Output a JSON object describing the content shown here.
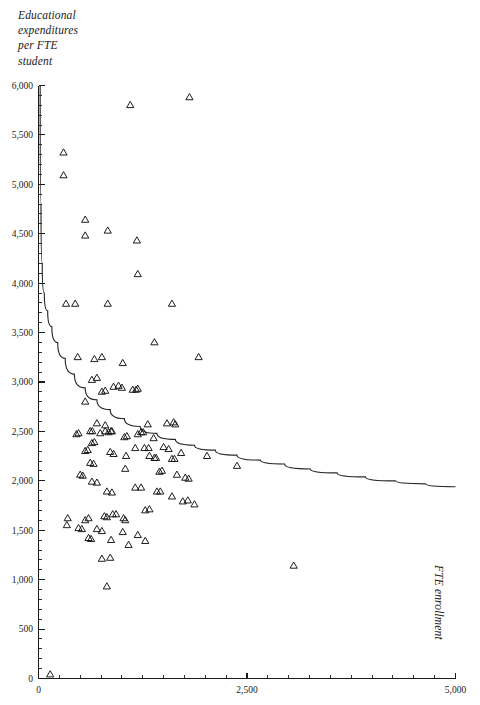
{
  "chart_data": {
    "type": "scatter",
    "title": "",
    "subtitle": "",
    "ylabel": "Educational\nexpenditures\nper FTE\nstudent",
    "xlabel": "FTE enrollment",
    "xlim": [
      0,
      5000
    ],
    "ylim": [
      0,
      6000
    ],
    "grid": false,
    "legend": null,
    "marker": "open-triangle",
    "x_ticks_major": [
      0,
      2500,
      5000
    ],
    "x_tick_labels": [
      "0",
      "2,500",
      "5,000"
    ],
    "x_tick_minor_step": 250,
    "y_ticks_major": [
      0,
      500,
      1000,
      1500,
      2000,
      2500,
      3000,
      3500,
      4000,
      4500,
      5000,
      5500,
      6000
    ],
    "y_tick_labels": [
      "0",
      "500",
      "1,000",
      "1,500",
      "2,000",
      "2,500",
      "3,000",
      "3,500",
      "4,000",
      "4,500",
      "5,000",
      "5,500",
      "6,000"
    ],
    "y_tick_minor_step": 100,
    "series": [
      {
        "name": "Institutions",
        "marker": "open-triangle",
        "points": [
          [
            140,
            40
          ],
          [
            300,
            5320
          ],
          [
            300,
            5090
          ],
          [
            1100,
            5800
          ],
          [
            1810,
            5880
          ],
          [
            560,
            4640
          ],
          [
            560,
            4480
          ],
          [
            830,
            4530
          ],
          [
            1180,
            4430
          ],
          [
            1190,
            4090
          ],
          [
            330,
            3790
          ],
          [
            440,
            3790
          ],
          [
            830,
            3790
          ],
          [
            1600,
            3790
          ],
          [
            1390,
            3400
          ],
          [
            1920,
            3250
          ],
          [
            470,
            3250
          ],
          [
            670,
            3230
          ],
          [
            760,
            3250
          ],
          [
            1010,
            3190
          ],
          [
            640,
            3020
          ],
          [
            700,
            3040
          ],
          [
            900,
            2950
          ],
          [
            960,
            2960
          ],
          [
            1000,
            2940
          ],
          [
            1130,
            2920
          ],
          [
            1170,
            2920
          ],
          [
            1190,
            2930
          ],
          [
            760,
            2900
          ],
          [
            800,
            2910
          ],
          [
            560,
            2800
          ],
          [
            700,
            2580
          ],
          [
            800,
            2560
          ],
          [
            1310,
            2570
          ],
          [
            1540,
            2580
          ],
          [
            1620,
            2590
          ],
          [
            1640,
            2570
          ],
          [
            740,
            2480
          ],
          [
            800,
            2500
          ],
          [
            840,
            2490
          ],
          [
            870,
            2500
          ],
          [
            880,
            2500
          ],
          [
            480,
            2480
          ],
          [
            455,
            2470
          ],
          [
            620,
            2500
          ],
          [
            645,
            2500
          ],
          [
            1190,
            2470
          ],
          [
            1230,
            2490
          ],
          [
            1255,
            2490
          ],
          [
            1030,
            2440
          ],
          [
            1060,
            2450
          ],
          [
            1380,
            2430
          ],
          [
            640,
            2380
          ],
          [
            670,
            2390
          ],
          [
            1160,
            2330
          ],
          [
            1270,
            2330
          ],
          [
            1320,
            2330
          ],
          [
            1500,
            2340
          ],
          [
            1560,
            2320
          ],
          [
            1710,
            2280
          ],
          [
            560,
            2300
          ],
          [
            590,
            2310
          ],
          [
            860,
            2290
          ],
          [
            900,
            2270
          ],
          [
            1050,
            2250
          ],
          [
            1330,
            2250
          ],
          [
            1390,
            2230
          ],
          [
            1410,
            2230
          ],
          [
            1600,
            2220
          ],
          [
            1630,
            2220
          ],
          [
            2020,
            2250
          ],
          [
            2380,
            2150
          ],
          [
            620,
            2180
          ],
          [
            660,
            2170
          ],
          [
            1040,
            2120
          ],
          [
            1450,
            2090
          ],
          [
            1480,
            2100
          ],
          [
            1660,
            2060
          ],
          [
            1760,
            2030
          ],
          [
            1800,
            2020
          ],
          [
            500,
            2060
          ],
          [
            530,
            2050
          ],
          [
            640,
            1990
          ],
          [
            700,
            1980
          ],
          [
            1160,
            1930
          ],
          [
            1230,
            1930
          ],
          [
            1420,
            1890
          ],
          [
            1460,
            1890
          ],
          [
            820,
            1890
          ],
          [
            880,
            1880
          ],
          [
            1600,
            1840
          ],
          [
            1730,
            1790
          ],
          [
            1790,
            1800
          ],
          [
            1870,
            1760
          ],
          [
            350,
            1620
          ],
          [
            340,
            1550
          ],
          [
            560,
            1600
          ],
          [
            600,
            1620
          ],
          [
            790,
            1640
          ],
          [
            820,
            1630
          ],
          [
            890,
            1660
          ],
          [
            930,
            1660
          ],
          [
            1280,
            1700
          ],
          [
            1330,
            1710
          ],
          [
            1020,
            1620
          ],
          [
            1040,
            1600
          ],
          [
            480,
            1520
          ],
          [
            520,
            1510
          ],
          [
            700,
            1510
          ],
          [
            760,
            1490
          ],
          [
            1010,
            1480
          ],
          [
            1190,
            1450
          ],
          [
            600,
            1420
          ],
          [
            630,
            1410
          ],
          [
            870,
            1400
          ],
          [
            1080,
            1350
          ],
          [
            1280,
            1390
          ],
          [
            760,
            1210
          ],
          [
            860,
            1220
          ],
          [
            3060,
            1140
          ],
          [
            820,
            930
          ]
        ]
      }
    ],
    "fit_curve": {
      "name": "fitted-cost-curve",
      "description": "decaying average-cost curve",
      "points": [
        [
          20,
          6000
        ],
        [
          30,
          4800
        ],
        [
          45,
          4200
        ],
        [
          70,
          3900
        ],
        [
          110,
          3720
        ],
        [
          160,
          3560
        ],
        [
          230,
          3400
        ],
        [
          320,
          3240
        ],
        [
          430,
          3080
        ],
        [
          560,
          2940
        ],
        [
          700,
          2820
        ],
        [
          860,
          2720
        ],
        [
          1030,
          2630
        ],
        [
          1220,
          2550
        ],
        [
          1420,
          2480
        ],
        [
          1640,
          2420
        ],
        [
          1870,
          2360
        ],
        [
          2120,
          2310
        ],
        [
          2380,
          2260
        ],
        [
          2660,
          2210
        ],
        [
          2950,
          2170
        ],
        [
          3260,
          2120
        ],
        [
          3580,
          2080
        ],
        [
          3920,
          2040
        ],
        [
          4280,
          2000
        ],
        [
          4640,
          1970
        ],
        [
          5000,
          1940
        ]
      ]
    }
  }
}
